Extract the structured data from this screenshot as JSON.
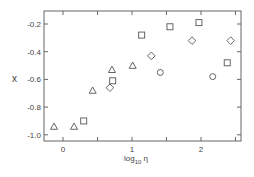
{
  "chart_data": {
    "type": "scatter",
    "title": "",
    "xlabel": "log10 η",
    "ylabel": "x",
    "xlim": [
      -0.28,
      2.58
    ],
    "ylim": [
      -1.05,
      -0.1
    ],
    "xticks": [
      0,
      0.5,
      1,
      1.5,
      2,
      2.5
    ],
    "xtick_labels": [
      "0",
      "",
      "1",
      "",
      "2",
      ""
    ],
    "yticks": [
      -0.2,
      -0.4,
      -0.6,
      -0.8,
      -1.0
    ],
    "ytick_labels": [
      "-0.2",
      "-0.4",
      "-0.6",
      "-0.8",
      "-1.0"
    ],
    "grid": false,
    "legend": null,
    "series": [
      {
        "name": "triangle",
        "marker": "triangle",
        "x": [
          -0.13,
          0.16,
          0.43,
          0.71,
          1.01
        ],
        "y": [
          -0.94,
          -0.94,
          -0.68,
          -0.53,
          -0.5
        ]
      },
      {
        "name": "square",
        "marker": "square",
        "x": [
          0.3,
          0.72,
          1.14,
          1.55,
          1.97,
          2.38
        ],
        "y": [
          -0.9,
          -0.61,
          -0.28,
          -0.22,
          -0.19,
          -0.48
        ]
      },
      {
        "name": "diamond",
        "marker": "diamond",
        "x": [
          0.68,
          1.28,
          1.87,
          2.43
        ],
        "y": [
          -0.66,
          -0.43,
          -0.32,
          -0.32
        ]
      },
      {
        "name": "circle",
        "marker": "circle",
        "x": [
          1.41,
          2.17
        ],
        "y": [
          -0.55,
          -0.58
        ]
      }
    ]
  },
  "labels": {
    "xlabel_main": "log",
    "xlabel_sub": "10",
    "xlabel_sym": "η",
    "ylabel": "x"
  },
  "colors": {
    "axis": "#555555",
    "marker": "#555555"
  }
}
